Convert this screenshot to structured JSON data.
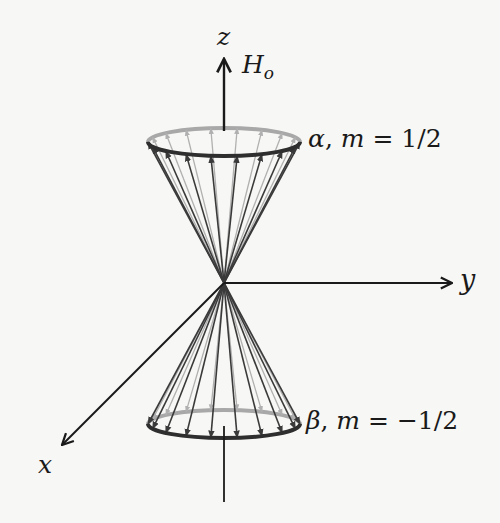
{
  "diagram": {
    "axes": {
      "z": "z",
      "y": "y",
      "x": "x"
    },
    "field": {
      "symbol": "H",
      "subscript": "o"
    },
    "states": [
      {
        "greek": "α",
        "sep": ", ",
        "m_label": "m",
        "eq": " = ",
        "value": "1/2"
      },
      {
        "greek": "β",
        "sep": ", ",
        "m_label": "m",
        "eq": " = ",
        "value": "−1/2"
      }
    ],
    "colors": {
      "background": "#f7f7f5",
      "axis": "#1a1a1a",
      "ring_front": "#2e2e2e",
      "ring_back": "#9a9a9a",
      "vector_front": "#3a3a3a",
      "vector_back": "#b0b0b0"
    },
    "geometry": {
      "origin": [
        224,
        283
      ],
      "top_ring": {
        "cx": 224,
        "cy": 142,
        "rx": 76,
        "ry": 14
      },
      "bottom_ring": {
        "cx": 224,
        "cy": 424,
        "rx": 76,
        "ry": 14
      },
      "vectors_per_cone": 18
    }
  }
}
